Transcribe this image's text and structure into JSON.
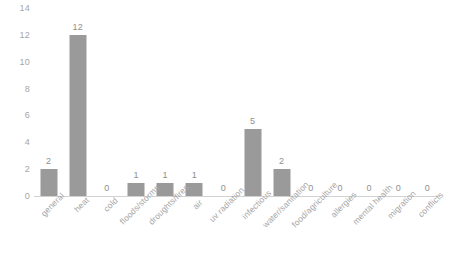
{
  "chart_data": {
    "type": "bar",
    "title": "",
    "subtitle": "",
    "xlabel": "",
    "ylabel": "",
    "ylim": [
      0,
      14
    ],
    "y_ticks": [
      0,
      2,
      4,
      6,
      8,
      10,
      12,
      14
    ],
    "grid": false,
    "legend": false,
    "legend_position": "none",
    "bar_color": "#9a9a9a",
    "text_color": "#a6a6a6",
    "axis_color": "#d2d2d2",
    "data_labels_shown": true,
    "categories": [
      "general",
      "heat",
      "cold",
      "floods/storms",
      "droughts/fires",
      "air",
      "uv radiation",
      "infectious",
      "water/sanitation",
      "food/agriculture",
      "allergies",
      "mental health",
      "migration",
      "conflicts"
    ],
    "values": [
      2,
      12,
      0,
      1,
      1,
      1,
      0,
      5,
      2,
      0,
      0,
      0,
      0,
      0
    ],
    "value_labels": [
      "2",
      "12",
      "0",
      "1",
      "1",
      "1",
      "0",
      "5",
      "2",
      "0",
      "0",
      "0",
      "0",
      "0"
    ]
  }
}
